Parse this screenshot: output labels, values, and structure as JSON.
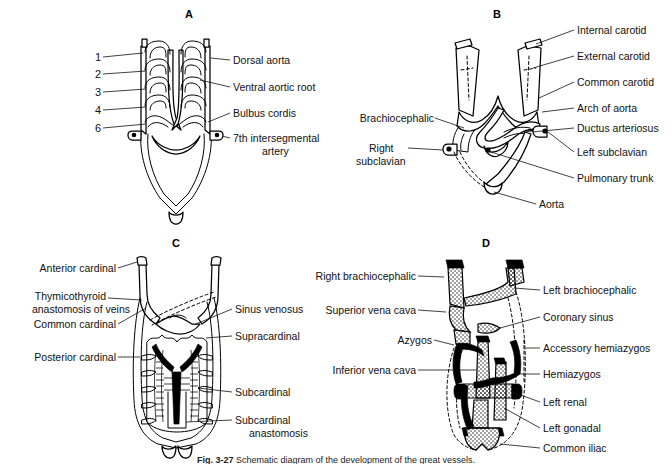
{
  "figure": {
    "caption_label": "Fig. 3-27",
    "caption_text": "Schematic diagram of the development of the great vessels."
  },
  "panels": [
    {
      "id": "A",
      "letter": "A",
      "title": "Embryonic aortic arch system",
      "arch_numbers": [
        "1",
        "2",
        "3",
        "4",
        "6"
      ],
      "labels_right": [
        "Dorsal aorta",
        "Ventral aortic root",
        "Bulbus cordis",
        "7th intersegmental",
        "artery"
      ]
    },
    {
      "id": "B",
      "letter": "B",
      "title": "Adult derivatives of the aortic arches",
      "labels_right": [
        "Internal carotid",
        "External carotid",
        "Common carotid",
        "Arch of aorta",
        "Ductus arteriosus",
        "Left subclavian",
        "Pulmonary trunk",
        "Aorta"
      ],
      "labels_left": [
        "Brachiocephalic",
        "Right",
        "subclavian"
      ]
    },
    {
      "id": "C",
      "letter": "C",
      "title": "Embryonic cardinal vein system",
      "labels_left": [
        "Anterior cardinal",
        "Thymicothyroid",
        "anastomosis of veins",
        "Common cardinal",
        "Posterior cardinal"
      ],
      "labels_right": [
        "Sinus venosus",
        "Supracardinal",
        "Subcardinal",
        "Subcardinal",
        "anastomosis"
      ]
    },
    {
      "id": "D",
      "letter": "D",
      "title": "Adult venous system",
      "labels_left": [
        "Right brachiocephalic",
        "Superior vena cava",
        "Azygos",
        "Inferior vena cava"
      ],
      "labels_right": [
        "Left brachiocephalic",
        "Coronary sinus",
        "Accessory hemiazygos",
        "Hemiazygos",
        "Left renal",
        "Left gonadal",
        "Common iliac"
      ]
    }
  ],
  "colors": {
    "ink": "#000000",
    "paper": "#ffffff"
  }
}
